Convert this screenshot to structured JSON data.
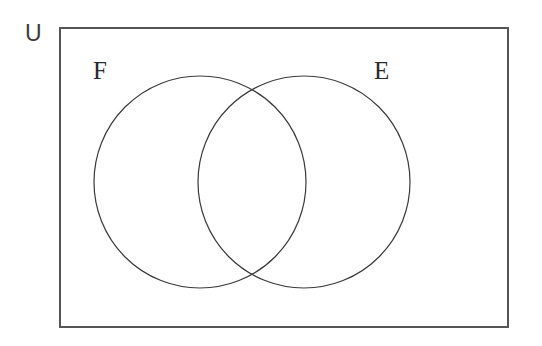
{
  "figure": {
    "kind": "venn-diagram",
    "title_text": "",
    "background_color": "#ffffff",
    "width": 542,
    "height": 346
  },
  "universe": {
    "label": "U",
    "label_position": "outside-top-left",
    "rect": {
      "x": 60,
      "y": 28,
      "width": 448,
      "height": 299
    },
    "stroke_color": "#555555",
    "stroke_width": 1.6,
    "fill_color": "#ffffff"
  },
  "sets": [
    {
      "id": "set-f",
      "label": "F",
      "label_position": "outside-upper-left",
      "cx": 200,
      "cy": 182,
      "r": 106,
      "stroke_color": "#3a3a3a",
      "stroke_width": 1.2,
      "fill_color": "none"
    },
    {
      "id": "set-e",
      "label": "E",
      "label_position": "outside-upper-right",
      "cx": 304,
      "cy": 182,
      "r": 106,
      "stroke_color": "#3a3a3a",
      "stroke_width": 1.2,
      "fill_color": "none"
    }
  ],
  "regions": {
    "f_only": "",
    "e_only": "",
    "intersection": "",
    "outside": ""
  },
  "chart_data": {
    "type": "venn",
    "title": "",
    "universe_label": "U",
    "set_labels": [
      "F",
      "E"
    ],
    "set_count": 2,
    "region_values": {
      "F only": "",
      "E only": "",
      "F and E": "",
      "neither": ""
    },
    "shaded_regions": []
  }
}
